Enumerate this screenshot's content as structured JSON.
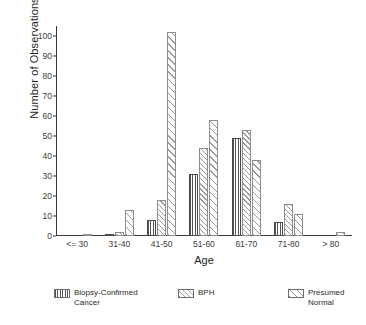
{
  "chart_data": {
    "type": "bar",
    "title": "",
    "xlabel": "Age",
    "ylabel": "Number of Observations",
    "categories": [
      "<= 30",
      "31-40",
      "41-50",
      "51-60",
      "61-70",
      "71-80",
      "> 80"
    ],
    "series": [
      {
        "name": "Biopsy-Confirmed\nCancer",
        "legend_label_line1": "Biopsy-Confirmed",
        "legend_label_line2": "Cancer",
        "pattern": "vertical",
        "values": [
          0,
          1,
          8,
          31,
          49,
          7,
          0
        ]
      },
      {
        "name": "BPH",
        "legend_label_line1": "BPH",
        "legend_label_line2": "",
        "pattern": "dense-diagonal",
        "values": [
          0,
          2,
          18,
          44,
          53,
          16,
          0
        ]
      },
      {
        "name": "Presumed\nNormal",
        "legend_label_line1": "Presumed",
        "legend_label_line2": "Normal",
        "pattern": "sparse-diagonal",
        "values": [
          1,
          13,
          102,
          58,
          38,
          11,
          2
        ]
      }
    ],
    "ylim": [
      0,
      105
    ],
    "yticks": [
      0,
      10,
      20,
      30,
      40,
      50,
      60,
      70,
      80,
      90,
      100
    ],
    "ytick_labels": [
      "0",
      "10",
      "20",
      "30",
      "40",
      "50",
      "60",
      "70",
      "80",
      "90",
      "100"
    ],
    "grid": false,
    "legend_position": "bottom",
    "colors": {
      "axis": "#3a3a3a",
      "bar_outline": "#6d6d6d",
      "hatch_dark": "#555555",
      "hatch_light": "#9a9a9a",
      "background": "#ffffff"
    }
  }
}
